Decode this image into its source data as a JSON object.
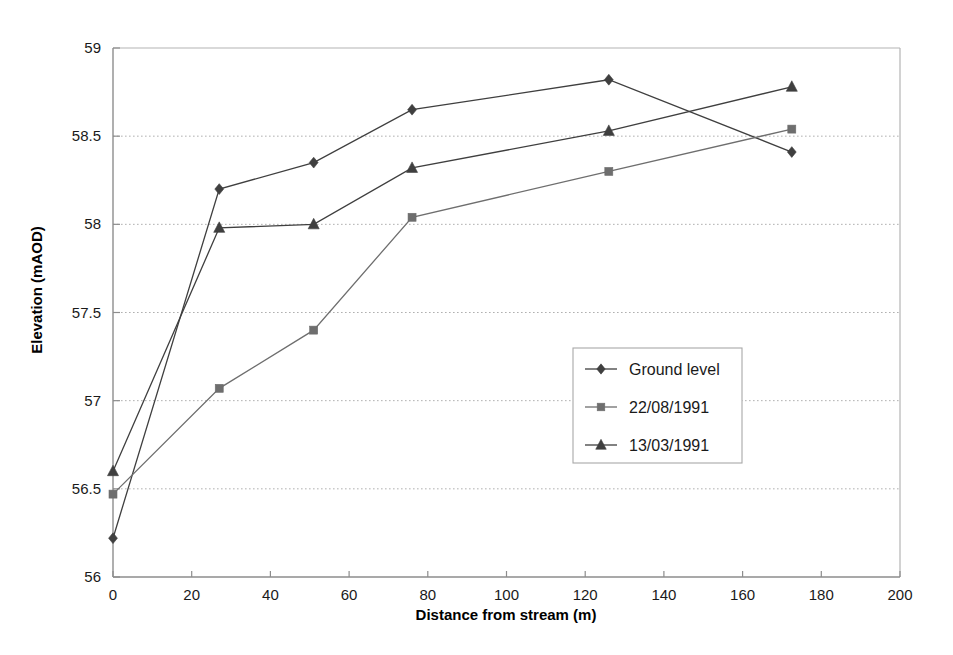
{
  "chart_data": {
    "type": "line",
    "title": "",
    "xlabel": "Distance from stream (m)",
    "ylabel": "Elevation (mAOD)",
    "xlim": [
      0,
      200
    ],
    "ylim": [
      56,
      59
    ],
    "xticks": [
      0,
      20,
      40,
      60,
      80,
      100,
      120,
      140,
      160,
      180,
      200
    ],
    "xtick_labels": [
      "0",
      "20",
      "40",
      "60",
      "80",
      "100",
      "120",
      "140",
      "160",
      "180",
      "200"
    ],
    "yticks": [
      56,
      56.5,
      57,
      57.5,
      58,
      58.5,
      59
    ],
    "ytick_labels": [
      "56",
      "56.5",
      "57",
      "57.5",
      "58",
      "58.5",
      "59"
    ],
    "grid": "horizontal-dotted",
    "legend_position": "center-right-inside",
    "series": [
      {
        "name": "Ground level",
        "marker": "diamond",
        "color": "#3f3f3f",
        "x": [
          0,
          27,
          51,
          76,
          126,
          172.5
        ],
        "values": [
          56.22,
          58.2,
          58.35,
          58.65,
          58.82,
          58.41
        ]
      },
      {
        "name": "22/08/1991",
        "marker": "square",
        "color": "#6e6e6e",
        "x": [
          0,
          27,
          51,
          76,
          126,
          172.5
        ],
        "values": [
          56.47,
          57.07,
          57.4,
          58.04,
          58.3,
          58.54
        ]
      },
      {
        "name": "13/03/1991",
        "marker": "triangle",
        "color": "#3f3f3f",
        "x": [
          0,
          27,
          51,
          76,
          126,
          172.5
        ],
        "values": [
          56.6,
          57.98,
          58.0,
          58.32,
          58.53,
          58.78
        ]
      }
    ]
  },
  "legend": {
    "entries": [
      {
        "label": "Ground level"
      },
      {
        "label": "22/08/1991"
      },
      {
        "label": "13/03/1991"
      }
    ]
  },
  "axes": {
    "x_title": "Distance from stream (m)",
    "y_title": "Elevation (mAOD)"
  }
}
